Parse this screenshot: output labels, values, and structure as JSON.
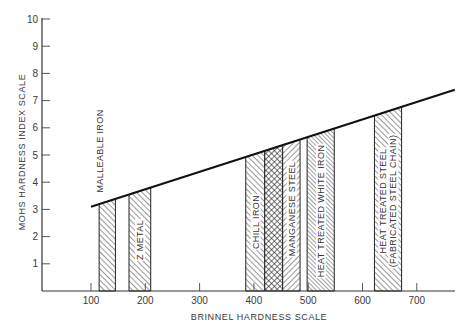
{
  "chart_data": {
    "type": "bar",
    "title": "",
    "xlabel": "BRINNEL HARDNESS SCALE",
    "ylabel": "MOHS HARDNESS INDEX SCALE",
    "xlim": [
      0,
      770
    ],
    "ylim": [
      0,
      10
    ],
    "x_ticks": [
      100,
      200,
      300,
      400,
      500,
      600,
      700
    ],
    "y_ticks": [
      1,
      2,
      3,
      4,
      5,
      6,
      7,
      8,
      9,
      10
    ],
    "grid": false,
    "legend": "none (labels drawn on bars)",
    "trend_line": {
      "description": "Linear relation between Brinnel and Mohs hardness",
      "points": [
        [
          100,
          3.1
        ],
        [
          770,
          7.4
        ]
      ]
    },
    "bars": [
      {
        "name": "MALLEABLE IRON",
        "brinell_min": 115,
        "brinell_max": 145,
        "mohs_top": 3.3,
        "hatch": "back-diagonal",
        "label_position": "above"
      },
      {
        "name": "Z METAL",
        "brinell_min": 170,
        "brinell_max": 210,
        "mohs_top": 3.8,
        "hatch": "back-diagonal",
        "label_position": "inside"
      },
      {
        "name": "CHILL IRON",
        "brinell_min": 385,
        "brinell_max": 420,
        "mohs_top": 5.2,
        "hatch": "back-diagonal",
        "label_position": "inside"
      },
      {
        "name": "",
        "brinell_min": 420,
        "brinell_max": 453,
        "mohs_top": 5.4,
        "hatch": "crosshatch",
        "label_position": "none"
      },
      {
        "name": "MANGANESE STEEL",
        "brinell_min": 453,
        "brinell_max": 485,
        "mohs_top": 5.6,
        "hatch": "forward-diagonal",
        "label_position": "inside"
      },
      {
        "name": "HEAT TREATED WHITE IRON",
        "brinell_min": 498,
        "brinell_max": 548,
        "mohs_top": 6.0,
        "hatch": "back-diagonal-dense",
        "label_position": "inside"
      },
      {
        "name": "HEAT TREATED STEEL",
        "sublabel": "(FABRICATED STEEL CHAIN)",
        "brinell_min": 622,
        "brinell_max": 672,
        "mohs_top": 6.8,
        "hatch": "back-diagonal",
        "label_position": "inside"
      }
    ]
  },
  "layout": {
    "plot": {
      "x0": 42,
      "y0": 291,
      "x_right": 455,
      "y_top": 18
    },
    "x_map": {
      "v0": 100,
      "px0": 91,
      "px_per_unit": 0.543
    },
    "y_map": {
      "px0": 291,
      "px_per_unit": 27.2
    }
  }
}
